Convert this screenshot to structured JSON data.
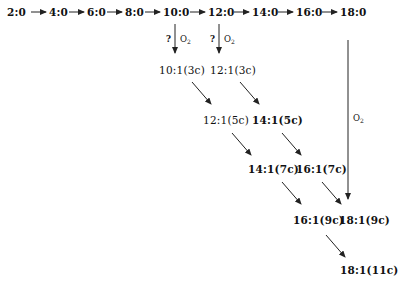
{
  "diagram": {
    "type": "fatty-acid desaturation/elongation pathway",
    "top_row": [
      "2:0",
      "4:0",
      "6:0",
      "8:0",
      "10:0",
      "12:0",
      "14:0",
      "16:0",
      "18:0"
    ],
    "branch_labels": {
      "question": "?",
      "oxygen": "O",
      "oxygen_sub": "2"
    },
    "nodes": {
      "n10_1_3c": "10:1(3c)",
      "n12_1_3c": "12:1(3c)",
      "n12_1_5c": "12:1(5c)",
      "n14_1_5c": "14:1(5c)",
      "n14_1_7c": "14:1(7c)",
      "n16_1_7c": "16:1(7c)",
      "n16_1_9c": "16:1(9c)",
      "n18_1_9c": "18:1(9c)",
      "n18_1_11c": "18:1(11c)"
    },
    "edges": [
      {
        "from": "2:0",
        "to": "4:0"
      },
      {
        "from": "4:0",
        "to": "6:0"
      },
      {
        "from": "6:0",
        "to": "8:0"
      },
      {
        "from": "8:0",
        "to": "10:0"
      },
      {
        "from": "10:0",
        "to": "12:0"
      },
      {
        "from": "12:0",
        "to": "14:0"
      },
      {
        "from": "14:0",
        "to": "16:0"
      },
      {
        "from": "16:0",
        "to": "18:0"
      },
      {
        "from": "10:0",
        "to": "10:1(3c)",
        "label": "? O2"
      },
      {
        "from": "12:0",
        "to": "12:1(3c)",
        "label": "? O2"
      },
      {
        "from": "10:1(3c)",
        "to": "12:1(5c)"
      },
      {
        "from": "12:1(3c)",
        "to": "14:1(5c)"
      },
      {
        "from": "12:1(5c)",
        "to": "14:1(7c)"
      },
      {
        "from": "14:1(5c)",
        "to": "16:1(7c)"
      },
      {
        "from": "14:1(7c)",
        "to": "16:1(9c)"
      },
      {
        "from": "16:1(7c)",
        "to": "18:1(9c)"
      },
      {
        "from": "18:0",
        "to": "18:1(9c)",
        "label": "O2"
      },
      {
        "from": "16:1(9c)",
        "to": "18:1(11c)"
      }
    ]
  }
}
